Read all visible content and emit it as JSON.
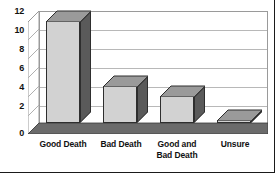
{
  "chart_data": {
    "type": "bar",
    "title": "",
    "subtitle": "",
    "xlabel": "",
    "ylabel": "",
    "categories": [
      "Good Death",
      "Bad Death",
      "Good and Bad Death",
      "Unsure"
    ],
    "category_lines": [
      [
        "Good Death"
      ],
      [
        "Bad Death"
      ],
      [
        "Good and",
        "Bad Death"
      ],
      [
        "Unsure"
      ]
    ],
    "values": [
      12,
      5,
      4,
      1
    ],
    "ylim": [
      0,
      12
    ],
    "yticks": [
      0,
      2,
      4,
      6,
      8,
      10,
      12
    ],
    "ytick_labels": [
      "0",
      "2",
      "4",
      "6",
      "8",
      "10",
      "12"
    ],
    "grid": true,
    "grid_axis": "y",
    "legend": false,
    "legend_position": "none",
    "style": "3d-column",
    "series": [
      {
        "name": "Responses",
        "values": [
          12,
          5,
          4,
          1
        ]
      }
    ]
  },
  "colors": {
    "bar_front": "#d2d2d2",
    "bar_side": "#5a5a5a",
    "bar_top": "#9a9a9a",
    "bar_outline": "#2e2e2e",
    "gridline": "#b8b8b8",
    "wall": "#9a9a9a",
    "floor_front": "#6b6b6b",
    "floor_top": "#ffffff",
    "text": "#111111",
    "background": "#ffffff",
    "border": "#1a1a1a"
  }
}
